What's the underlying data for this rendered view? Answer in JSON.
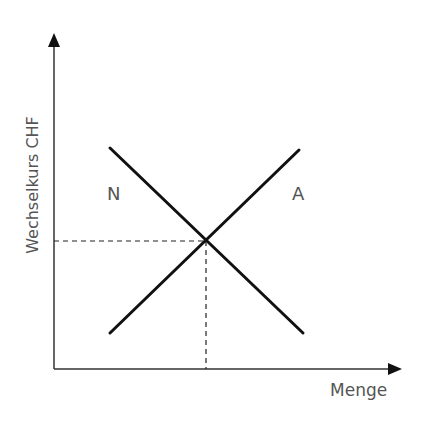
{
  "diagram": {
    "type": "supply-demand",
    "y_axis_label": "Wechselkurs CHF",
    "x_axis_label": "Menge",
    "curves": [
      {
        "name": "N",
        "label": "N",
        "meaning": "Nachfrage",
        "direction": "downward"
      },
      {
        "name": "A",
        "label": "A",
        "meaning": "Angebot",
        "direction": "upward"
      }
    ],
    "equilibrium": {
      "marked_with_dashed_lines": true
    }
  },
  "colors": {
    "line": "#111111",
    "axis": "#333333",
    "text": "#555555",
    "background": "#ffffff"
  }
}
